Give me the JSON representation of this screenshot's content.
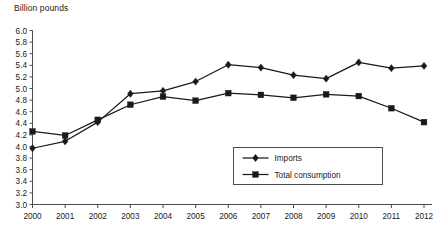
{
  "chart_data": {
    "type": "line",
    "title": "Billion pounds",
    "xlabel": "",
    "ylabel": "Billion pounds",
    "ylim": [
      3.0,
      6.0
    ],
    "ytick_step": 0.2,
    "grid": false,
    "legend_position": "inside-bottom-right",
    "categories": [
      "2000",
      "2001",
      "2002",
      "2003",
      "2004",
      "2005",
      "2006",
      "2007",
      "2008",
      "2009",
      "2010",
      "2011",
      "2012"
    ],
    "ytick_labels": [
      "3.0",
      "3.2",
      "3.4",
      "3.6",
      "3.8",
      "4.0",
      "4.2",
      "4.4",
      "4.6",
      "4.8",
      "5.0",
      "5.2",
      "5.4",
      "5.6",
      "5.8",
      "6.0"
    ],
    "series": [
      {
        "name": "Imports",
        "marker": "diamond",
        "values": [
          3.97,
          4.09,
          4.42,
          4.91,
          4.96,
          5.12,
          5.41,
          5.36,
          5.23,
          5.17,
          5.45,
          5.35,
          5.39
        ]
      },
      {
        "name": "Total consumption",
        "marker": "square",
        "values": [
          4.26,
          4.19,
          4.46,
          4.72,
          4.86,
          4.79,
          4.92,
          4.89,
          4.84,
          4.9,
          4.87,
          4.66,
          4.42
        ]
      }
    ],
    "colors": {
      "series_line": "#1a1a1a",
      "axis": "#4d4d4d",
      "text": "#1a1a1a",
      "background": "#ffffff"
    }
  },
  "legend": {
    "items": [
      {
        "label": "Imports"
      },
      {
        "label": "Total consumption"
      }
    ]
  }
}
